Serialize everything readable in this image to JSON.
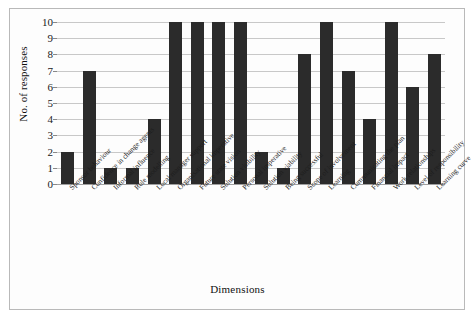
{
  "chart_data": {
    "type": "bar",
    "title": "",
    "xlabel": "Dimensions",
    "ylabel": "No. of responses",
    "ylim": [
      0,
      10
    ],
    "yticks": [
      0,
      1,
      2,
      3,
      4,
      5,
      6,
      7,
      8,
      9,
      10
    ],
    "grid": true,
    "legend": "none",
    "bar_color": "#2b2b2b",
    "categories": [
      "Sponsor behaviour",
      "Confidence in change agents",
      "Informal influence",
      "Role modelling",
      "Local manager support",
      "Organisational imperative",
      "Future state vision",
      "Solution visibility",
      "Personal imperative",
      "Solution viability",
      "Being successful",
      "Scope of involvement",
      "Learning",
      "Communicating the plan",
      "Financial impact",
      "Work relationships",
      "Level of responsibility",
      "Learning curve"
    ],
    "values": [
      2,
      7,
      1,
      1,
      4,
      10,
      10,
      10,
      10,
      2,
      1,
      8,
      10,
      7,
      4,
      10,
      6,
      8
    ]
  }
}
